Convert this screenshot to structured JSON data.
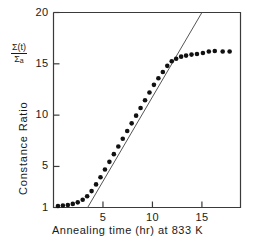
{
  "chart_data": {
    "type": "scatter",
    "title": "",
    "xlabel": "Annealing time (hr) at 833 K",
    "ylabel": "Constance Ratio",
    "ylabel_symbol_numerator": "Σ(t)",
    "ylabel_symbol_denominator": "Σ",
    "ylabel_symbol_denominator_sub": "a",
    "xlim": [
      0,
      18.9
    ],
    "ylim": [
      1,
      20
    ],
    "xticks": [
      5,
      10,
      15
    ],
    "xtick_labels": [
      "5",
      "10",
      "15"
    ],
    "yticks": [
      1,
      5,
      10,
      15,
      20
    ],
    "ytick_labels": [
      "1",
      "5",
      "10",
      "15",
      "20"
    ],
    "grid": false,
    "legend": "none",
    "frame": "box",
    "marker": "filled-circle",
    "marker_color": "#111111",
    "line_color": "#555555",
    "series": [
      {
        "name": "Constance ratio data",
        "marker": "filled-circle",
        "x": [
          0.45,
          0.95,
          1.45,
          1.95,
          2.45,
          2.95,
          3.4,
          3.85,
          4.3,
          4.75,
          5.2,
          5.65,
          6.1,
          6.55,
          7.0,
          7.45,
          7.9,
          8.35,
          8.8,
          9.25,
          9.7,
          10.15,
          10.6,
          11.05,
          11.5,
          11.95,
          12.4,
          12.9,
          13.4,
          13.95,
          14.5,
          15.1,
          15.7,
          16.3,
          17.1,
          17.8
        ],
        "y": [
          1.15,
          1.2,
          1.25,
          1.35,
          1.5,
          1.75,
          2.1,
          2.6,
          3.25,
          3.95,
          4.7,
          5.45,
          6.2,
          6.95,
          7.7,
          8.45,
          9.2,
          9.95,
          10.7,
          11.45,
          12.2,
          12.95,
          13.6,
          14.2,
          14.8,
          15.25,
          15.5,
          15.7,
          15.8,
          15.9,
          15.95,
          16.05,
          16.2,
          16.25,
          16.2,
          16.2
        ]
      }
    ],
    "fit_line": {
      "name": "linear extrapolation",
      "x": [
        3.45,
        15.0
      ],
      "y": [
        1.0,
        20.0
      ],
      "slope": 1.645,
      "x_intercept_at_y1": 3.45
    }
  }
}
